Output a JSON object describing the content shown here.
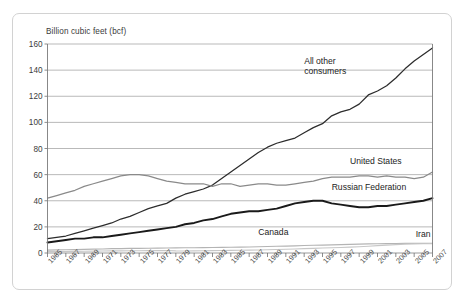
{
  "figure": {
    "y_axis_title": "Billion cubic feet (bcf)"
  },
  "chart_data": {
    "type": "line",
    "title": "",
    "subtitle": "",
    "xlabel": "",
    "ylabel": "Billion cubic feet (bcf)",
    "ylim": [
      0,
      160
    ],
    "xlim": [
      1965,
      2007
    ],
    "y_ticks": [
      0,
      20,
      40,
      60,
      80,
      100,
      120,
      140,
      160
    ],
    "y_tick_labels": [
      "0",
      "20",
      "40",
      "60",
      "80",
      "100",
      "120",
      "140",
      "160"
    ],
    "grid": true,
    "grid_axis": "y",
    "legend": "inline-annotations",
    "x": [
      1965,
      1966,
      1967,
      1968,
      1969,
      1970,
      1971,
      1972,
      1973,
      1974,
      1975,
      1976,
      1977,
      1978,
      1979,
      1980,
      1981,
      1982,
      1983,
      1984,
      1985,
      1986,
      1987,
      1988,
      1989,
      1990,
      1991,
      1992,
      1993,
      1994,
      1995,
      1996,
      1997,
      1998,
      1999,
      2000,
      2001,
      2002,
      2003,
      2004,
      2005,
      2006,
      2007
    ],
    "x_tick_values": [
      1965,
      1967,
      1969,
      1971,
      1973,
      1975,
      1977,
      1979,
      1981,
      1983,
      1985,
      1987,
      1989,
      1991,
      1993,
      1995,
      1997,
      1999,
      2001,
      2003,
      2005,
      2007
    ],
    "x_tick_labels": [
      "1965",
      "1967",
      "1969",
      "1971",
      "1973",
      "1975",
      "1977",
      "1979",
      "1981",
      "1983",
      "1985",
      "1987",
      "1989",
      "1991",
      "1993",
      "1995",
      "1997",
      "1999",
      "2001",
      "2003",
      "2005",
      "2007"
    ],
    "series": [
      {
        "name": "All other consumers",
        "color": "#2c2c2c",
        "width": 1.25,
        "label_position": {
          "x": 1993.0,
          "y": 146
        },
        "values": [
          11,
          12,
          13,
          15,
          17,
          19,
          21,
          23,
          26,
          28,
          31,
          34,
          36,
          38,
          42,
          45,
          47,
          49,
          52,
          57,
          62,
          67,
          72,
          77,
          81,
          84,
          86,
          88,
          92,
          96,
          99,
          105,
          108,
          110,
          114,
          121,
          124,
          128,
          134,
          141,
          147,
          152,
          157
        ]
      },
      {
        "name": "United States",
        "color": "#8a8a8a",
        "width": 1.25,
        "label_position": {
          "x": 1998.0,
          "y": 70
        },
        "values": [
          42,
          44,
          46,
          48,
          51,
          53,
          55,
          57,
          59,
          60,
          60,
          59,
          57,
          55,
          54,
          53,
          53,
          53,
          51,
          53,
          53,
          51,
          52,
          53,
          53,
          52,
          52,
          53,
          54,
          55,
          57,
          58,
          58,
          58,
          59,
          59,
          58,
          59,
          58,
          58,
          57,
          58,
          62
        ]
      },
      {
        "name": "Russian Federation",
        "color": "#1a1a1a",
        "width": 1.9,
        "label_position": {
          "x": 1996.0,
          "y": 50
        },
        "values": [
          8,
          9,
          10,
          11,
          11,
          12,
          12,
          13,
          14,
          15,
          16,
          17,
          18,
          19,
          20,
          22,
          23,
          25,
          26,
          28,
          30,
          31,
          32,
          32,
          33,
          34,
          36,
          38,
          39,
          40,
          40,
          38,
          37,
          36,
          35,
          35,
          36,
          36,
          37,
          38,
          39,
          40,
          42
        ]
      },
      {
        "name": "Canada",
        "color": "#b4b4b4",
        "width": 1.15,
        "label_position": {
          "x": 1988.0,
          "y": 15
        },
        "values": [
          2.2,
          2.4,
          2.5,
          2.6,
          2.8,
          3.0,
          3.1,
          3.3,
          3.4,
          3.5,
          3.5,
          3.6,
          3.7,
          3.8,
          3.9,
          4.0,
          4.0,
          4.1,
          4.2,
          4.3,
          4.4,
          4.5,
          4.6,
          4.8,
          5.0,
          5.2,
          5.3,
          5.5,
          5.7,
          5.9,
          6.0,
          6.2,
          6.4,
          6.6,
          6.8,
          7.0,
          7.1,
          7.2,
          7.3,
          7.4,
          7.4,
          7.4,
          7.5
        ]
      },
      {
        "name": "Iran",
        "color": "#c7c7c7",
        "width": 1.15,
        "label_position": {
          "x": 2005.5,
          "y": 14
        },
        "values": [
          1.0,
          1.1,
          1.1,
          1.2,
          1.3,
          1.4,
          1.5,
          1.6,
          1.6,
          1.7,
          1.7,
          1.8,
          1.8,
          1.9,
          1.6,
          1.5,
          1.6,
          1.7,
          1.8,
          1.9,
          2.0,
          2.1,
          2.2,
          2.3,
          2.5,
          2.7,
          2.9,
          3.1,
          3.3,
          3.5,
          3.8,
          4.0,
          4.2,
          4.5,
          4.8,
          5.2,
          5.6,
          6.0,
          6.4,
          6.8,
          7.0,
          7.1,
          7.2
        ]
      }
    ],
    "annotations": [
      {
        "text_line1": "All other",
        "text_line2": "consumers"
      },
      {
        "text_line1": "United States",
        "text_line2": ""
      },
      {
        "text_line1": "Russian Federation",
        "text_line2": ""
      },
      {
        "text_line1": "Canada",
        "text_line2": ""
      },
      {
        "text_line1": "Iran",
        "text_line2": ""
      }
    ]
  }
}
